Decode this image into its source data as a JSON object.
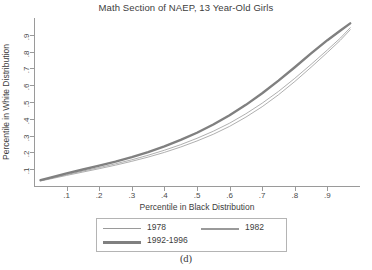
{
  "chart_data": {
    "type": "line",
    "title": "Math Section of NAEP, 13 Year-Old Girls",
    "xlabel": "Percentile in Black Distribution",
    "ylabel": "Percentile in White Distribution",
    "xlim": [
      0.0,
      1.0
    ],
    "ylim": [
      0.0,
      1.0
    ],
    "xticks": [
      0.1,
      0.2,
      0.3,
      0.4,
      0.5,
      0.6,
      0.7,
      0.8,
      0.9
    ],
    "yticks": [
      0.1,
      0.2,
      0.3,
      0.4,
      0.5,
      0.6,
      0.7,
      0.8,
      0.9
    ],
    "xticklabels": [
      ".1",
      ".2",
      ".3",
      ".4",
      ".5",
      ".6",
      ".7",
      ".8",
      ".9"
    ],
    "yticklabels": [
      ".1",
      ".2",
      ".3",
      ".4",
      ".5",
      ".6",
      ".7",
      ".8",
      ".9"
    ],
    "grid": false,
    "legend_position": "below-axes",
    "line_color": "#8a8a8a",
    "series": [
      {
        "name": "1978",
        "linewidth": "thin",
        "color": "#9a9a9a",
        "x": [
          0.02,
          0.05,
          0.1,
          0.15,
          0.2,
          0.25,
          0.3,
          0.35,
          0.4,
          0.45,
          0.5,
          0.55,
          0.6,
          0.65,
          0.7,
          0.75,
          0.8,
          0.85,
          0.9,
          0.94,
          0.97
        ],
        "y": [
          0.03,
          0.042,
          0.063,
          0.083,
          0.103,
          0.124,
          0.147,
          0.172,
          0.2,
          0.232,
          0.268,
          0.308,
          0.355,
          0.41,
          0.472,
          0.543,
          0.622,
          0.707,
          0.795,
          0.868,
          0.93
        ]
      },
      {
        "name": "1982",
        "linewidth": "thin",
        "color": "#9a9a9a",
        "x": [
          0.02,
          0.05,
          0.1,
          0.15,
          0.2,
          0.25,
          0.3,
          0.35,
          0.4,
          0.45,
          0.5,
          0.55,
          0.6,
          0.65,
          0.7,
          0.75,
          0.8,
          0.85,
          0.9,
          0.94,
          0.97
        ],
        "y": [
          0.032,
          0.045,
          0.068,
          0.089,
          0.11,
          0.132,
          0.156,
          0.183,
          0.213,
          0.246,
          0.284,
          0.326,
          0.374,
          0.43,
          0.493,
          0.563,
          0.641,
          0.724,
          0.81,
          0.881,
          0.942
        ]
      },
      {
        "name": "1992-1996",
        "linewidth": "thick",
        "color": "#808080",
        "x": [
          0.02,
          0.05,
          0.1,
          0.15,
          0.2,
          0.25,
          0.3,
          0.35,
          0.4,
          0.45,
          0.5,
          0.55,
          0.6,
          0.65,
          0.7,
          0.75,
          0.8,
          0.85,
          0.9,
          0.94,
          0.97
        ],
        "y": [
          0.035,
          0.05,
          0.075,
          0.098,
          0.121,
          0.145,
          0.172,
          0.202,
          0.236,
          0.274,
          0.317,
          0.366,
          0.421,
          0.483,
          0.552,
          0.627,
          0.707,
          0.789,
          0.868,
          0.926,
          0.968
        ]
      }
    ]
  },
  "legend": {
    "entries": [
      {
        "label": "1978"
      },
      {
        "label": "1982"
      },
      {
        "label": "1992-1996"
      }
    ]
  },
  "caption": "(d)"
}
